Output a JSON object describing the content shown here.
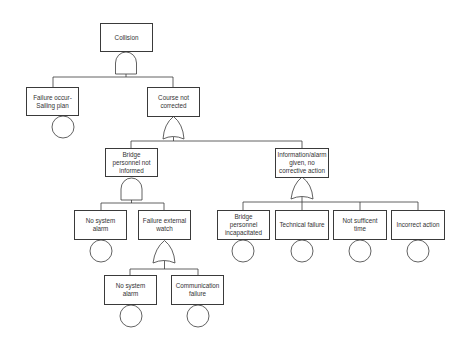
{
  "diagram": {
    "type": "fault-tree",
    "colors": {
      "line": "#3a3a3a",
      "text": "#333333",
      "background": "#ffffff"
    },
    "nodes": {
      "collision": {
        "label": "Collision",
        "gate": "AND"
      },
      "failure_sailing_plan": {
        "label": "Failure occur- Sailing plan",
        "basic_event": true
      },
      "course_not_corrected": {
        "label": "Course not corrected",
        "gate": "OR"
      },
      "bridge_not_informed": {
        "label": "Bridge personnel not informed",
        "gate": "AND"
      },
      "info_alarm_given": {
        "label": "Information/alarm given, no corrective action",
        "gate": "OR"
      },
      "no_system_alarm_1": {
        "label": "No system alarm",
        "basic_event": true
      },
      "failure_external_watch": {
        "label": "Failure external watch",
        "gate": "OR"
      },
      "no_system_alarm_2": {
        "label": "No system alarm",
        "basic_event": true
      },
      "communication_failure": {
        "label": "Communication failure",
        "basic_event": true
      },
      "bridge_incapacitated": {
        "label": "Bridge personnel incapacitated",
        "basic_event": true
      },
      "technical_failure": {
        "label": "Technical failure",
        "basic_event": true
      },
      "not_sufficient_time": {
        "label": "Not sufficent time",
        "basic_event": true
      },
      "incorrect_action": {
        "label": "Incorrect action",
        "basic_event": true
      }
    }
  }
}
